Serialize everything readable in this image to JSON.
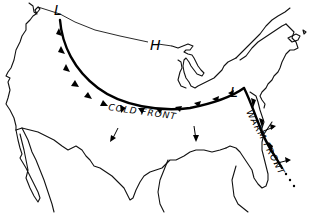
{
  "map": {
    "subject": "United States weather map sketch",
    "pressure_systems": [
      {
        "type": "low",
        "symbol": "L",
        "location": "Pacific Northwest"
      },
      {
        "type": "high",
        "symbol": "H",
        "location": "Northern Plains / Great Lakes"
      },
      {
        "type": "low",
        "symbol": "L",
        "location": "Ohio Valley / Mid-Atlantic"
      }
    ],
    "fronts": [
      {
        "type": "cold",
        "label": "COLD FRONT",
        "color": "#000000"
      },
      {
        "type": "warm",
        "label": "WARM FRONT",
        "color": "#000000"
      }
    ],
    "arrows_count": 4
  },
  "labels": {
    "low_nw": "L",
    "high": "H",
    "low_east": "L",
    "cold_front": "COLD FRONT",
    "warm_front": "WARM FRONT"
  }
}
